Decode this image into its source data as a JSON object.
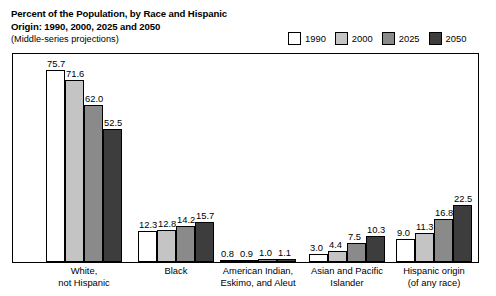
{
  "chart_data": {
    "type": "bar",
    "title": "Percent of the Population, by Race and Hispanic Origin: 1990, 2000, 2025 and 2050",
    "title_line1": "Percent of the Population, by Race and Hispanic",
    "title_line2": "Origin: 1990, 2000, 2025 and 2050",
    "subtitle": "(Middle-series projections)",
    "xlabel": "",
    "ylabel": "",
    "ylim": [
      0,
      80
    ],
    "grid": false,
    "legend_position": "top-right",
    "categories": [
      "White, not Hispanic",
      "Black",
      "American Indian, Eskimo, and Aleut",
      "Asian and Pacific Islander",
      "Hispanic origin (of any race)"
    ],
    "category_lines": [
      [
        "White,",
        "not Hispanic"
      ],
      [
        "Black"
      ],
      [
        "American Indian,",
        "Eskimo, and Aleut"
      ],
      [
        "Asian and Pacific",
        "Islander"
      ],
      [
        "Hispanic origin",
        "(of any race)"
      ]
    ],
    "series": [
      {
        "name": "1990",
        "color": "#ffffff",
        "values": [
          75.7,
          12.3,
          0.8,
          3.0,
          9.0
        ]
      },
      {
        "name": "2000",
        "color": "#c4c4c4",
        "values": [
          71.6,
          12.8,
          0.9,
          4.4,
          11.3
        ]
      },
      {
        "name": "2025",
        "color": "#8a8a8a",
        "values": [
          62.0,
          14.2,
          1.0,
          7.5,
          16.8
        ]
      },
      {
        "name": "2050",
        "color": "#3d3d3d",
        "values": [
          52.5,
          15.7,
          1.1,
          10.3,
          22.5
        ]
      }
    ],
    "value_labels": [
      [
        "75.7",
        "71.6",
        "62.0",
        "52.5"
      ],
      [
        "12.3",
        "12.8",
        "14.2",
        "15.7"
      ],
      [
        "0.8",
        "0.9",
        "1.0",
        "1.1"
      ],
      [
        "3.0",
        "4.4",
        "7.5",
        "10.3"
      ],
      [
        "9.0",
        "11.3",
        "16.8",
        "22.5"
      ]
    ]
  },
  "legend": {
    "items": [
      {
        "label": "1990",
        "color": "#ffffff"
      },
      {
        "label": "2000",
        "color": "#c4c4c4"
      },
      {
        "label": "2025",
        "color": "#8a8a8a"
      },
      {
        "label": "2050",
        "color": "#3d3d3d"
      }
    ]
  }
}
